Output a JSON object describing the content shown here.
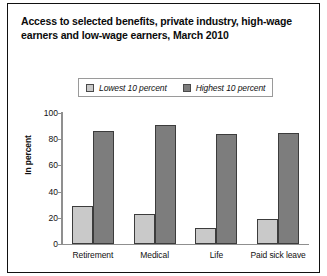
{
  "chart_data": {
    "type": "bar",
    "title": "Access to selected benefits, private industry, high-wage earners and low-wage earners, March 2010",
    "title_lines": [
      "Access to selected benefits, private industry, high-wage",
      "earners and low-wage earners, March 2010"
    ],
    "categories": [
      "Retirement",
      "Medical",
      "Life",
      "Paid sick leave"
    ],
    "series": [
      {
        "name": "Lowest 10 percent",
        "color": "#c9c9c9",
        "values": [
          29,
          23,
          12,
          19
        ]
      },
      {
        "name": "Highest 10 percent",
        "color": "#7d7d7d",
        "values": [
          86,
          91,
          84,
          85
        ]
      }
    ],
    "xlabel": "",
    "ylabel": "In percent",
    "ylim": [
      0,
      100
    ],
    "yticks": [
      100,
      80,
      60,
      40,
      20,
      0
    ],
    "grid": false,
    "legend_position": "top-center"
  },
  "legend": {
    "entries": [
      {
        "label": "Lowest 10 percent"
      },
      {
        "label": "Highest 10 percent"
      }
    ]
  },
  "colors": {
    "low_series": "#c9c9c9",
    "high_series": "#7d7d7d",
    "axis": "#8f8f8f",
    "frame": "#111111",
    "text": "#111111"
  }
}
